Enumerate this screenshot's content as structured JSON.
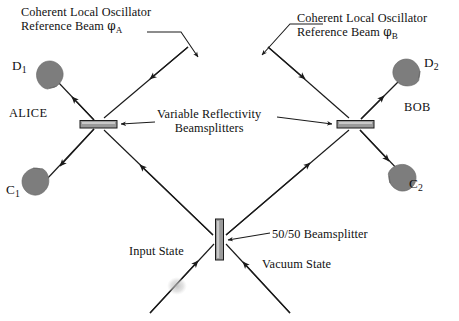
{
  "figure": {
    "background_color": "#ffffff",
    "stroke_color": "#1a1a1a",
    "element_fill_color": "#808080",
    "beamsplitter_fill_color": "#9a9a9a",
    "width": 459,
    "height": 321
  },
  "labels": {
    "lo_a_line1": "Coherent Local Oscillator",
    "lo_a_line2_prefix": "Reference Beam ",
    "lo_a_symbol": "φ",
    "lo_a_subscript": "A",
    "lo_b_line1": "Coherent Local Oscillator",
    "lo_b_line2_prefix": "Reference Beam ",
    "lo_b_symbol": "φ",
    "lo_b_subscript": "B",
    "alice": "ALICE",
    "bob": "BOB",
    "variable_bs_line1": "Variable Reflectivity",
    "variable_bs_line2": "Beamsplitters",
    "beamsplitter_5050": "50/50 Beamsplitter",
    "input_state": "Input State",
    "vacuum_state": "Vacuum State"
  },
  "detectors": [
    {
      "id": "D1",
      "base": "D",
      "subscript": "1",
      "party": "ALICE",
      "position": "upper-left"
    },
    {
      "id": "C1",
      "base": "C",
      "subscript": "1",
      "party": "ALICE",
      "position": "lower-left"
    },
    {
      "id": "D2",
      "base": "D",
      "subscript": "2",
      "party": "BOB",
      "position": "upper-right"
    },
    {
      "id": "C2",
      "base": "C",
      "subscript": "2",
      "party": "BOB",
      "position": "lower-right"
    }
  ],
  "components": [
    {
      "id": "vbs-alice",
      "name": "Variable Reflectivity Beamsplitter A",
      "orientation": "horizontal"
    },
    {
      "id": "vbs-bob",
      "name": "Variable Reflectivity Beamsplitter B",
      "orientation": "horizontal"
    },
    {
      "id": "bs-5050",
      "name": "50/50 Beamsplitter",
      "orientation": "vertical"
    }
  ],
  "beams": [
    {
      "id": "input-state",
      "label": "Input State"
    },
    {
      "id": "vacuum-state",
      "label": "Vacuum State"
    },
    {
      "id": "lo-a",
      "label": "Coherent Local Oscillator Reference Beam φA"
    },
    {
      "id": "lo-b",
      "label": "Coherent Local Oscillator Reference Beam φB"
    }
  ]
}
